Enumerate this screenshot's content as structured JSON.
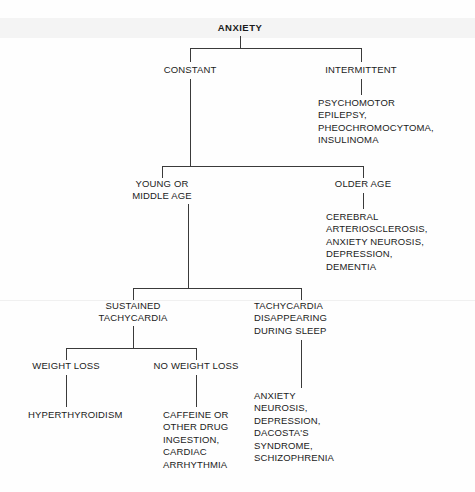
{
  "diagram": {
    "title": "ANXIETY",
    "type": "differential-diagnosis-flowchart",
    "nodes": {
      "root": "ANXIETY",
      "constant": "CONSTANT",
      "intermittent": "INTERMITTENT",
      "intermittent_causes": "PSYCHOMOTOR\nEPILEPSY,\nPHEOCHROMOCYTOMA,\nINSULINOMA",
      "young_or_middle_age": "YOUNG OR\nMIDDLE AGE",
      "older_age": "OLDER AGE",
      "older_age_causes": "CEREBRAL\nARTERIOSCLEROSIS,\nANXIETY NEUROSIS,\nDEPRESSION,\nDEMENTIA",
      "sustained_tachycardia": "SUSTAINED\nTACHYCARDIA",
      "tachycardia_sleep": "TACHYCARDIA\nDISAPPEARING\nDURING SLEEP",
      "tachycardia_sleep_causes": "ANXIETY\nNEUROSIS,\nDEPRESSION,\nDACOSTA'S\nSYNDROME,\nSCHIZOPHRENIA",
      "weight_loss": "WEIGHT LOSS",
      "no_weight_loss": "NO WEIGHT LOSS",
      "weight_loss_causes": "HYPERTHYROIDISM",
      "no_weight_loss_causes": "CAFFEINE OR\nOTHER DRUG\nINGESTION,\nCARDIAC\nARRHYTHMIA"
    },
    "colors": {
      "line": "#3a3a3a",
      "text": "#1b1b1b",
      "background": "#fefefe"
    }
  }
}
